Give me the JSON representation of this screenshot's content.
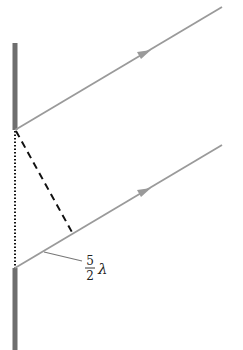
{
  "diagram": {
    "title": "",
    "colors": {
      "barrier": "#6e6e6e",
      "ray": "#9a9a9a",
      "dashed": "#111111",
      "dotted": "#111111",
      "text": "#222222",
      "background": "#ffffff"
    },
    "barriers": [
      {
        "name": "upper-barrier",
        "x": 15,
        "y1": 43,
        "y2": 130
      },
      {
        "name": "lower-barrier",
        "x": 15,
        "y1": 268,
        "y2": 350
      }
    ],
    "rays": [
      {
        "name": "upper-ray",
        "x1": 15,
        "y1": 130,
        "x2": 222,
        "y2": 7,
        "arrow_at": [
          148,
          52
        ]
      },
      {
        "name": "lower-ray",
        "x1": 15,
        "y1": 268,
        "x2": 222,
        "y2": 145,
        "arrow_at": [
          148,
          190
        ]
      }
    ],
    "slit_separation_line": {
      "style": "dotted",
      "x1": 15,
      "y1": 130,
      "x2": 15,
      "y2": 268
    },
    "path_difference_line": {
      "style": "dashed",
      "x1": 15,
      "y1": 130,
      "x2": 73,
      "y2": 234
    },
    "label": {
      "numerator": "5",
      "denominator": "2",
      "symbol": "λ",
      "text": "5/2 λ",
      "leader": {
        "x1": 44,
        "y1": 252,
        "x2": 82,
        "y2": 261
      }
    }
  }
}
